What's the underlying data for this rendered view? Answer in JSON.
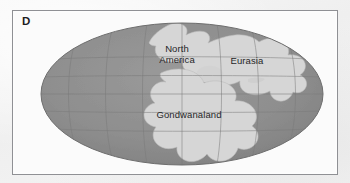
{
  "figure": {
    "panel_label": "D",
    "frame_color": "#8f9094",
    "background_color": "#f4f4f4",
    "panel_background_color": "#fbfbfb"
  },
  "map": {
    "projection": "oval",
    "ocean_color": "#8f8f8f",
    "land_color": "#d4d4d4",
    "graticule_color": "#7d7d7d",
    "outline_color": "#6e6e6e",
    "labels": [
      {
        "id": "north-america",
        "text": "North\nAmerica"
      },
      {
        "id": "eurasia",
        "text": "Eurasia"
      },
      {
        "id": "gondwanaland",
        "text": "Gondwanaland"
      }
    ],
    "graticule": {
      "meridian_count": 7,
      "parallel_count": 5
    }
  }
}
